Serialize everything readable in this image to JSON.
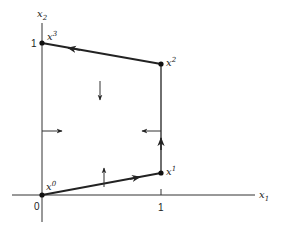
{
  "axes": {
    "x_label": "x",
    "x_sub": "1",
    "y_label": "x",
    "y_sub": "2",
    "origin_label": "0",
    "x_tick_label": "1",
    "y_tick_label": "1"
  },
  "points": [
    {
      "name": "x0",
      "base": "x",
      "sup": "0",
      "coords": [
        0,
        0
      ]
    },
    {
      "name": "x1",
      "base": "x",
      "sup": "1",
      "coords": [
        1,
        0.2
      ]
    },
    {
      "name": "x2",
      "base": "x",
      "sup": "2",
      "coords": [
        1,
        0.85
      ]
    },
    {
      "name": "x3",
      "base": "x",
      "sup": "3",
      "coords": [
        0,
        1
      ]
    }
  ],
  "colors": {
    "line": "#222222",
    "background": "#ffffff"
  }
}
